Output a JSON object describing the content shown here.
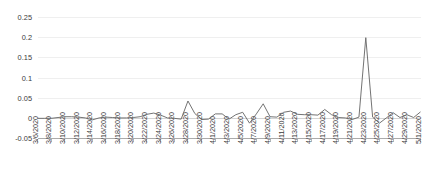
{
  "chart_data": {
    "type": "line",
    "title": "",
    "xlabel": "",
    "ylabel": "",
    "ylim": [
      -0.05,
      0.25
    ],
    "yticks": [
      -0.05,
      0,
      0.05,
      0.1,
      0.15,
      0.2,
      0.25
    ],
    "ytick_labels": [
      "-0.05",
      "0",
      "0.05",
      "0.1",
      "0.15",
      "0.2",
      "0.25"
    ],
    "grid": true,
    "legend": "none",
    "line_color": "#6b6b6b",
    "grid_color": "#e8e8e8",
    "axis_color": "#9a9a9a",
    "xtick_labels": [
      "3/6/2020",
      "3/8/2020",
      "3/10/2020",
      "3/12/2020",
      "3/14/2020",
      "3/16/2020",
      "3/18/2020",
      "3/20/2020",
      "3/22/2020",
      "3/24/2020",
      "3/26/2020",
      "3/28/2020",
      "3/30/2020",
      "4/1/2020",
      "4/3/2020",
      "4/5/2020",
      "4/7/2020",
      "4/9/2020",
      "4/11/2020",
      "4/13/2020",
      "4/15/2020",
      "4/17/2020",
      "4/19/2020",
      "4/21/2020",
      "4/23/2020",
      "4/25/2020",
      "4/27/2020",
      "4/29/2020",
      "5/1/2020"
    ],
    "x": [
      "3/6/2020",
      "3/7/2020",
      "3/8/2020",
      "3/9/2020",
      "3/10/2020",
      "3/11/2020",
      "3/12/2020",
      "3/13/2020",
      "3/14/2020",
      "3/15/2020",
      "3/16/2020",
      "3/17/2020",
      "3/18/2020",
      "3/19/2020",
      "3/20/2020",
      "3/21/2020",
      "3/22/2020",
      "3/23/2020",
      "3/24/2020",
      "3/25/2020",
      "3/26/2020",
      "3/27/2020",
      "3/28/2020",
      "3/29/2020",
      "3/30/2020",
      "3/31/2020",
      "4/1/2020",
      "4/2/2020",
      "4/3/2020",
      "4/4/2020",
      "4/5/2020",
      "4/6/2020",
      "4/7/2020",
      "4/8/2020",
      "4/9/2020",
      "4/10/2020",
      "4/11/2020",
      "4/12/2020",
      "4/13/2020",
      "4/14/2020",
      "4/15/2020",
      "4/16/2020",
      "4/17/2020",
      "4/18/2020",
      "4/19/2020",
      "4/20/2020",
      "4/21/2020",
      "4/22/2020",
      "4/23/2020",
      "4/24/2020",
      "4/25/2020",
      "4/26/2020",
      "4/27/2020",
      "4/28/2020",
      "4/29/2020",
      "4/30/2020",
      "5/1/2020"
    ],
    "values": [
      0.0,
      0.0,
      0.0,
      0.002,
      0.004,
      0.004,
      0.003,
      0.001,
      -0.004,
      0.001,
      0.003,
      0.002,
      0.001,
      0.001,
      0.002,
      0.004,
      0.01,
      0.013,
      0.008,
      0.001,
      0.0,
      -0.002,
      0.043,
      0.012,
      -0.003,
      -0.002,
      0.011,
      0.011,
      -0.002,
      0.009,
      0.015,
      -0.012,
      0.011,
      0.036,
      0.004,
      0.003,
      0.015,
      0.018,
      0.01,
      0.009,
      0.009,
      0.008,
      0.022,
      0.009,
      0.002,
      0.001,
      -0.003,
      0.003,
      0.2,
      0.003,
      -0.012,
      0.001,
      0.014,
      0.002,
      0.009,
      0.002,
      0.016
    ]
  }
}
